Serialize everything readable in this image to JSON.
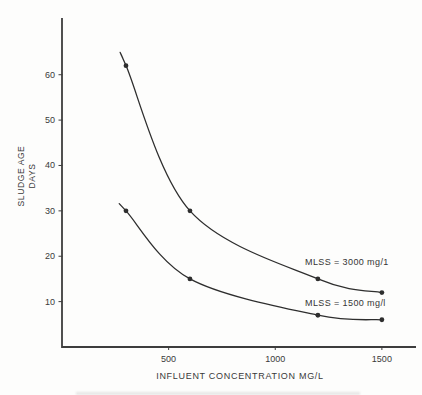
{
  "figure": {
    "background": "#fdfdfc"
  },
  "colors": {
    "axis": "#3d3d3d",
    "curve": "#2e2e2e",
    "text": "#3a3a3a"
  },
  "chart_data": {
    "type": "line",
    "title": "",
    "xlabel": "INFLUENT CONCENTRATION MG/L",
    "ylabel": "SLUDGE AGE DAYS",
    "ylabel_lines": [
      "SLUDGE AGE",
      "DAYS"
    ],
    "xlim": [
      0,
      1660
    ],
    "ylim": [
      0,
      72.5
    ],
    "x_ticks": [
      500,
      1000,
      1500
    ],
    "y_ticks": [
      10,
      20,
      30,
      40,
      50,
      60
    ],
    "grid": false,
    "legend_position": "inline-labels-right-of-curves",
    "marker": "filled-dot",
    "series": [
      {
        "name": "mlss-3000",
        "label": "MLSS = 3000 mg/1",
        "x": [
          300,
          600,
          1200,
          1500
        ],
        "y": [
          62,
          30,
          15,
          12
        ]
      },
      {
        "name": "mlss-1500",
        "label": "MLSS = 1500 mg/l",
        "x": [
          300,
          600,
          1200,
          1500
        ],
        "y": [
          30,
          15,
          7,
          6
        ]
      }
    ]
  }
}
